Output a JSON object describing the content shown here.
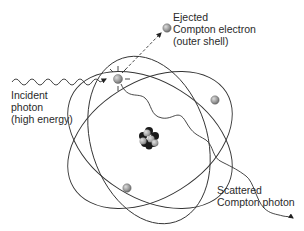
{
  "diagram": {
    "labels": {
      "incident": [
        "Incident",
        "photon",
        "(high energy)"
      ],
      "ejected": [
        "Ejected",
        "Compton electron",
        "(outer shell)"
      ],
      "scattered": [
        "Scattered",
        "Compton photon"
      ]
    },
    "elements": {
      "nucleus": "Nucleus (cluster of protons and neutrons)",
      "orbits": 3,
      "electrons_on_orbits": 3,
      "ejected_electron": 1
    },
    "colors": {
      "line": "#333333",
      "electron": "#9a9a9a",
      "nucleus_dark": "#1a1a1a",
      "nucleus_light": "#a8a8a8",
      "text": "#2a2a2a"
    }
  }
}
